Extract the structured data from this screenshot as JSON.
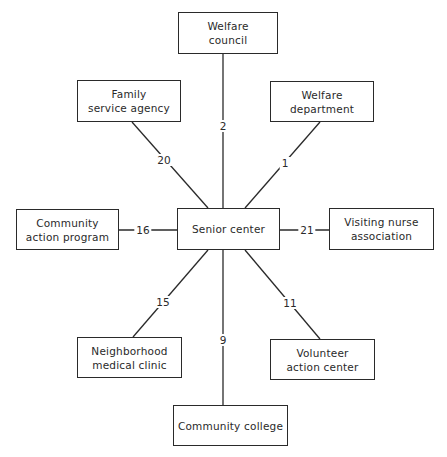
{
  "diagram": {
    "center": {
      "id": "senior",
      "label": "Senior center"
    },
    "nodes": [
      {
        "id": "welfare_council",
        "lines": [
          "Welfare",
          "council"
        ]
      },
      {
        "id": "family_service",
        "lines": [
          "Family",
          "service agency"
        ]
      },
      {
        "id": "welfare_dept",
        "lines": [
          "Welfare",
          "department"
        ]
      },
      {
        "id": "community_action",
        "lines": [
          "Community",
          "action program"
        ]
      },
      {
        "id": "visiting_nurse",
        "lines": [
          "Visiting nurse",
          "association"
        ]
      },
      {
        "id": "neighborhood_clinic",
        "lines": [
          "Neighborhood",
          "medical clinic"
        ]
      },
      {
        "id": "volunteer_center",
        "lines": [
          "Volunteer",
          "action center"
        ]
      },
      {
        "id": "community_college",
        "lines": [
          "Community college"
        ]
      }
    ],
    "edges": [
      {
        "from": "senior",
        "to": "welfare_council",
        "label": "2"
      },
      {
        "from": "senior",
        "to": "family_service",
        "label": "20"
      },
      {
        "from": "senior",
        "to": "welfare_dept",
        "label": "1"
      },
      {
        "from": "senior",
        "to": "community_action",
        "label": "16"
      },
      {
        "from": "senior",
        "to": "visiting_nurse",
        "label": "21"
      },
      {
        "from": "senior",
        "to": "neighborhood_clinic",
        "label": "15"
      },
      {
        "from": "senior",
        "to": "volunteer_center",
        "label": "11"
      },
      {
        "from": "senior",
        "to": "community_college",
        "label": "9"
      }
    ]
  }
}
